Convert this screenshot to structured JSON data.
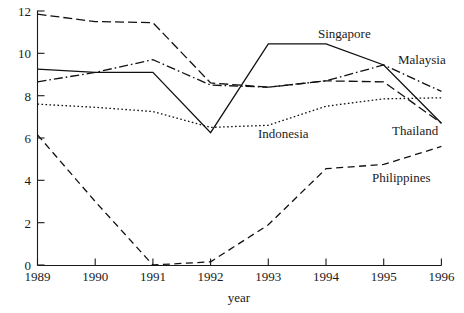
{
  "chart_data": {
    "type": "line",
    "title": "",
    "xlabel": "year",
    "ylabel": "",
    "x": [
      1989,
      1990,
      1991,
      1992,
      1993,
      1994,
      1995,
      1996
    ],
    "xtick_labels": [
      "1989",
      "1990",
      "1991",
      "1992",
      "1993",
      "1994",
      "1995",
      "1996"
    ],
    "ytick_labels": [
      "0",
      "2",
      "4",
      "6",
      "8",
      "10",
      "12"
    ],
    "yticks": [
      0,
      2,
      4,
      6,
      8,
      10,
      12
    ],
    "xlim": [
      1989,
      1996
    ],
    "ylim": [
      0,
      12
    ],
    "grid": false,
    "legend_position": "inline-annotations",
    "series": [
      {
        "name": "Singapore",
        "style": "solid",
        "color": "#111111",
        "values": [
          9.25,
          9.1,
          9.1,
          6.25,
          10.45,
          10.45,
          9.45,
          6.7
        ]
      },
      {
        "name": "Malaysia",
        "style": "dash-dot",
        "color": "#111111",
        "values": [
          8.65,
          9.1,
          9.7,
          8.5,
          8.4,
          8.7,
          9.45,
          8.2
        ]
      },
      {
        "name": "Thailand",
        "style": "long-dash",
        "color": "#111111",
        "values": [
          11.85,
          11.5,
          11.45,
          8.6,
          8.4,
          8.7,
          8.65,
          6.7
        ]
      },
      {
        "name": "Indonesia",
        "style": "dotted",
        "color": "#111111",
        "values": [
          7.6,
          7.45,
          7.25,
          6.5,
          6.6,
          7.5,
          7.85,
          7.9
        ]
      },
      {
        "name": "Philippines",
        "style": "dashed",
        "color": "#111111",
        "values": [
          6.15,
          3.0,
          0.0,
          0.15,
          1.9,
          4.55,
          4.75,
          5.6
        ]
      }
    ],
    "annotations": [
      {
        "text": "Singapore",
        "x": 318,
        "y": 38
      },
      {
        "text": "Malaysia",
        "x": 398,
        "y": 64
      },
      {
        "text": "Thailand",
        "x": 392,
        "y": 135
      },
      {
        "text": "Indonesia",
        "x": 258,
        "y": 138
      },
      {
        "text": "Philippines",
        "x": 372,
        "y": 182
      }
    ]
  },
  "axes": {
    "x_title": "year",
    "y_tick_values": [
      "12",
      "10",
      "8",
      "6",
      "4",
      "2",
      "0"
    ],
    "x_tick_values": [
      "1989",
      "1990",
      "1991",
      "1992",
      "1993",
      "1994",
      "1995",
      "1996"
    ]
  },
  "caption": {
    "text": ""
  }
}
